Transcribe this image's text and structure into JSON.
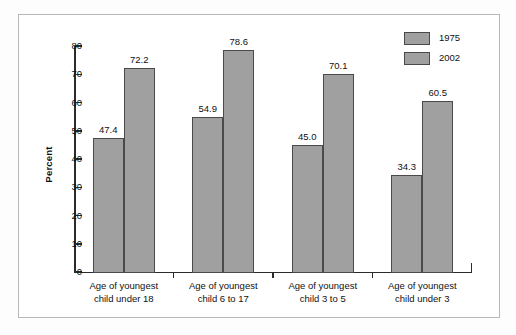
{
  "chart_data": {
    "type": "bar",
    "title": "",
    "xlabel": "",
    "ylabel": "Percent",
    "ylim": [
      0,
      80
    ],
    "ytick_step": 10,
    "yticks": [
      "0",
      "10",
      "20",
      "30",
      "40",
      "50",
      "60",
      "70",
      "80"
    ],
    "grid": false,
    "legend_position": "top-right",
    "categories": [
      "Age of youngest\nchild under 18",
      "Age of youngest\nchild 6 to 17",
      "Age of youngest\nchild 3 to 5",
      "Age of youngest\nchild under 3"
    ],
    "series": [
      {
        "name": "1975",
        "color": "#a0a0a0",
        "values": [
          47.4,
          54.9,
          45.0,
          34.3
        ]
      },
      {
        "name": "2002",
        "color": "#a0a0a0",
        "values": [
          72.2,
          78.6,
          70.1,
          60.5
        ]
      }
    ],
    "bar_labels": [
      [
        "47.4",
        "72.2"
      ],
      [
        "54.9",
        "78.6"
      ],
      [
        "45.0",
        "70.1"
      ],
      [
        "34.3",
        "60.5"
      ]
    ]
  },
  "legend": {
    "items": [
      {
        "label": "1975",
        "swatch": "legend-swatch-1975"
      },
      {
        "label": "2002",
        "swatch": "legend-swatch-2002"
      }
    ]
  },
  "axis": {
    "y_title": "Percent",
    "y_ticks": [
      "80",
      "70",
      "60",
      "50",
      "40",
      "30",
      "20",
      "10",
      "0"
    ]
  },
  "categories": [
    "Age of youngest\nchild under 18",
    "Age of youngest\nchild 6 to 17",
    "Age of youngest\nchild 3 to 5",
    "Age of youngest\nchild under 3"
  ],
  "bars": [
    {
      "group": 0,
      "series": "1975",
      "value": "47.4"
    },
    {
      "group": 0,
      "series": "2002",
      "value": "72.2"
    },
    {
      "group": 1,
      "series": "1975",
      "value": "54.9"
    },
    {
      "group": 1,
      "series": "2002",
      "value": "78.6"
    },
    {
      "group": 2,
      "series": "1975",
      "value": "45.0"
    },
    {
      "group": 2,
      "series": "2002",
      "value": "70.1"
    },
    {
      "group": 3,
      "series": "1975",
      "value": "34.3"
    },
    {
      "group": 3,
      "series": "2002",
      "value": "60.5"
    }
  ],
  "colors": {
    "bar_fill": "#a0a0a0",
    "bar_edge": "#4a4a4a",
    "axis": "#2b2b2b",
    "frame": "#b8b8b8",
    "plot_background": "#ffffff"
  }
}
